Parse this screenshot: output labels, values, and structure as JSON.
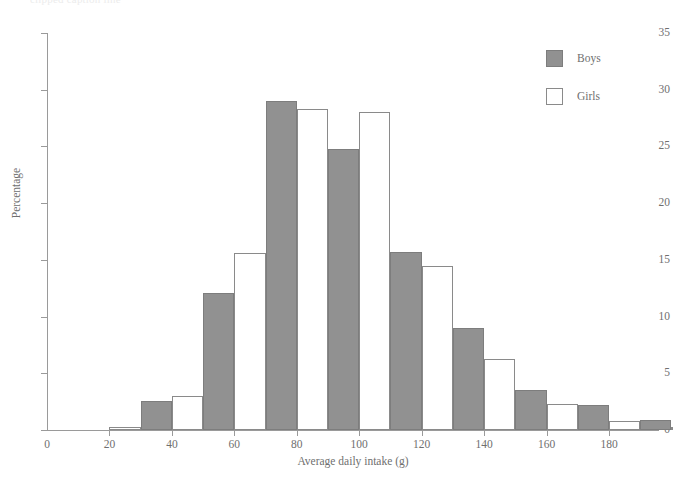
{
  "caption": {
    "partial_text": "clipped caption line"
  },
  "legend": {
    "position": "top-right",
    "entries": [
      {
        "label": "Boys",
        "swatch": "boys"
      },
      {
        "label": "Girls",
        "swatch": "girls"
      }
    ]
  },
  "axes": {
    "x_title": "Average daily intake (g)",
    "y_title": "Percentage",
    "x_ticks": [
      "0",
      "20",
      "40",
      "60",
      "80",
      "100",
      "120",
      "140",
      "160",
      "180"
    ],
    "y_ticks": [
      "0",
      "5",
      "10",
      "15",
      "20",
      "25",
      "30",
      "35"
    ]
  },
  "colors": {
    "boys_fill": "#919191",
    "boys_edge": "#7d7d7d",
    "girls_fill": "#ffffff",
    "girls_edge": "#8a8a8a",
    "axis": "#9a9a9a",
    "text": "#6f6f6f"
  },
  "chart_data": {
    "type": "bar",
    "title": "",
    "subtitle": "",
    "xlabel": "Average daily intake (g)",
    "ylabel": "Percentage",
    "xlim": [
      0,
      196
    ],
    "ylim": [
      0,
      35
    ],
    "ytick_values": [
      0,
      5,
      10,
      15,
      20,
      25,
      30,
      35
    ],
    "xtick_values": [
      0,
      20,
      40,
      60,
      80,
      100,
      120,
      140,
      160,
      180
    ],
    "grid": false,
    "legend_position": "top-right",
    "bin_width": 20,
    "bin_starts": [
      10,
      30,
      50,
      70,
      90,
      110,
      130,
      150,
      170
    ],
    "categories": [
      "10-30",
      "30-50",
      "50-70",
      "70-90",
      "90-110",
      "110-130",
      "130-150",
      "150-170",
      "170-190"
    ],
    "series": [
      {
        "name": "Boys",
        "values": [
          0.0,
          2.6,
          12.1,
          29.0,
          24.8,
          15.7,
          9.0,
          3.5,
          2.2
        ]
      },
      {
        "name": "Girls",
        "values": [
          0.3,
          3.0,
          15.6,
          28.3,
          28.0,
          14.5,
          6.3,
          2.3,
          0.8
        ]
      }
    ],
    "extra_bins": {
      "bin_start": 190,
      "note": "rightmost partial pair",
      "Boys": 0.9,
      "Girls": 0.3
    }
  }
}
